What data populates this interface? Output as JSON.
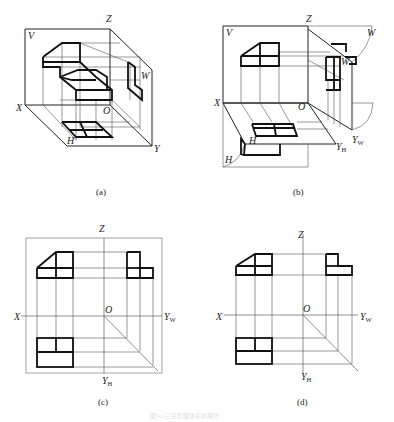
{
  "figure": {
    "caption": "图3-1  三投影面体系的展开",
    "panels": [
      {
        "id": "a",
        "caption": "(a)",
        "description": "Isometric view of object inside three-plane projection system",
        "labels": {
          "v": "V",
          "w": "W",
          "h": "H",
          "x": "X",
          "y": "Y",
          "z": "Z",
          "o": "O"
        }
      },
      {
        "id": "b",
        "caption": "(b)",
        "description": "Unfolding of H and W planes",
        "labels": {
          "v": "V",
          "w1": "W",
          "w2": "W",
          "h1": "H",
          "h2": "H",
          "x": "X",
          "z": "Z",
          "o": "O",
          "yh": "Y",
          "yh_sub": "H",
          "yw": "Y",
          "yw_sub": "W"
        }
      },
      {
        "id": "c",
        "caption": "(c)",
        "description": "Three views with projection plane borders",
        "labels": {
          "x": "X",
          "z": "Z",
          "o": "O",
          "yh": "Y",
          "yh_sub": "H",
          "yw": "Y",
          "yw_sub": "W"
        }
      },
      {
        "id": "d",
        "caption": "(d)",
        "description": "Three views without plane borders",
        "labels": {
          "x": "X",
          "z": "Z",
          "o": "O",
          "yh": "Y",
          "yh_sub": "H",
          "yw": "Y",
          "yw_sub": "W"
        }
      }
    ]
  }
}
